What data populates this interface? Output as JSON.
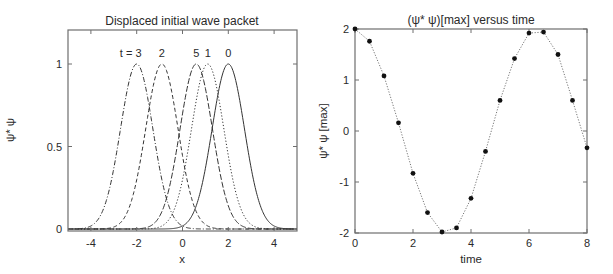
{
  "chart_data": [
    {
      "type": "line",
      "title": "Displaced initial wave packet",
      "xlabel": "x",
      "ylabel": "ψ* ψ",
      "xlim": [
        -5,
        5
      ],
      "ylim": [
        -0.03,
        1.2
      ],
      "xticks": [
        -4,
        -2,
        0,
        2,
        4
      ],
      "yticks": [
        0,
        0.5,
        1
      ],
      "ytick_labels": [
        "0",
        "0.5",
        "1"
      ],
      "grid": false,
      "legend": "inline labels above peaks",
      "function": "exp(-(x - center)^2)",
      "series": [
        {
          "name": "t = 0",
          "label": "0",
          "center": 2.0,
          "peak": 1.0,
          "style": "solid",
          "color": "#222222"
        },
        {
          "name": "t = 1",
          "label": "1",
          "center": 1.1,
          "peak": 1.0,
          "style": "dotted",
          "color": "#888888"
        },
        {
          "name": "t = 2",
          "label": "2",
          "center": -0.9,
          "peak": 1.0,
          "style": "dashed",
          "color": "#333333"
        },
        {
          "name": "t = 3",
          "label": "t = 3",
          "center": -2.0,
          "peak": 1.0,
          "style": "dashdot",
          "color": "#333333"
        },
        {
          "name": "t = 5",
          "label": "5",
          "center": 0.6,
          "peak": 1.0,
          "style": "longdash",
          "color": "#333333"
        }
      ]
    },
    {
      "type": "line",
      "title": "(ψ* ψ)[max] versus time",
      "xlabel": "time",
      "ylabel": "ψ* ψ [max]",
      "xlim": [
        0,
        8
      ],
      "ylim": [
        -2,
        2
      ],
      "xticks": [
        0,
        2,
        4,
        6,
        8
      ],
      "yticks": [
        -2,
        -1,
        0,
        1,
        2
      ],
      "grid": false,
      "series": [
        {
          "name": "(ψ* ψ)[max]",
          "style": "dotted line with filled circle markers",
          "color": "#111111",
          "x": [
            0,
            0.5,
            1.0,
            1.5,
            2.0,
            2.5,
            3.0,
            3.5,
            4.0,
            4.5,
            5.0,
            5.5,
            6.0,
            6.5,
            7.0,
            7.5,
            8.0
          ],
          "y": [
            2.0,
            1.76,
            1.08,
            0.16,
            -0.83,
            -1.6,
            -1.98,
            -1.9,
            -1.32,
            -0.4,
            0.6,
            1.42,
            1.92,
            1.94,
            1.5,
            0.6,
            -0.33
          ]
        }
      ]
    }
  ]
}
